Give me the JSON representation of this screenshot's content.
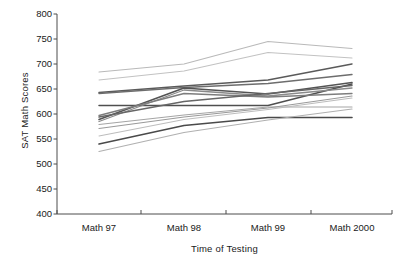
{
  "chart_data": {
    "type": "line",
    "title": "",
    "xlabel": "Time of Testing",
    "ylabel": "SAT Math Scores",
    "categories": [
      "Math 97",
      "Math 98",
      "Math 99",
      "Math 2000"
    ],
    "x": [
      99,
      184,
      268,
      352
    ],
    "ylim": [
      400,
      800
    ],
    "yticks": [
      400,
      450,
      500,
      550,
      600,
      650,
      700,
      750,
      800
    ],
    "grid": false,
    "legend": "none",
    "axis_spines": [
      "left",
      "bottom"
    ],
    "note": "Spaghetti plot of multiple institutions' mean SAT Math scores across four testing administrations; no legend shown, lines distinguished only by gray shade.",
    "series": [
      {
        "name": "series-1",
        "values": [
          684,
          700,
          745,
          731
        ],
        "color": "#b9b9b9",
        "width": 1.1
      },
      {
        "name": "series-2",
        "values": [
          668,
          686,
          723,
          712
        ],
        "color": "#c2c2c2",
        "width": 1.1
      },
      {
        "name": "series-3",
        "values": [
          643,
          656,
          668,
          700
        ],
        "color": "#5a5a5a",
        "width": 1.5
      },
      {
        "name": "series-4",
        "values": [
          641,
          653,
          661,
          679
        ],
        "color": "#6d6d6d",
        "width": 1.4
      },
      {
        "name": "series-5",
        "values": [
          617,
          617,
          617,
          660
        ],
        "color": "#4f4f4f",
        "width": 1.5
      },
      {
        "name": "series-6",
        "values": [
          589,
          652,
          640,
          663
        ],
        "color": "#545454",
        "width": 1.6
      },
      {
        "name": "series-7",
        "values": [
          585,
          648,
          636,
          652
        ],
        "color": "#8a8a8a",
        "width": 1.3
      },
      {
        "name": "series-8",
        "values": [
          597,
          641,
          634,
          641
        ],
        "color": "#7d7d7d",
        "width": 1.3
      },
      {
        "name": "series-9",
        "values": [
          579,
          598,
          614,
          614
        ],
        "color": "#a5a5a5",
        "width": 1.2
      },
      {
        "name": "series-10",
        "values": [
          571,
          594,
          612,
          636
        ],
        "color": "#9a9a9a",
        "width": 1.2
      },
      {
        "name": "series-11",
        "values": [
          556,
          589,
          609,
          632
        ],
        "color": "#bdbdbd",
        "width": 1.1
      },
      {
        "name": "series-12",
        "values": [
          540,
          577,
          593,
          593
        ],
        "color": "#4a4a4a",
        "width": 1.6
      },
      {
        "name": "series-13",
        "values": [
          525,
          563,
          588,
          610
        ],
        "color": "#b0b0b0",
        "width": 1.2
      },
      {
        "name": "series-14",
        "values": [
          594,
          625,
          641,
          657
        ],
        "color": "#666666",
        "width": 1.4
      }
    ]
  },
  "axes": {
    "left_px": 57,
    "right_px": 392,
    "top_px": 14,
    "bottom_px": 214,
    "color": "#4d4d4d"
  }
}
